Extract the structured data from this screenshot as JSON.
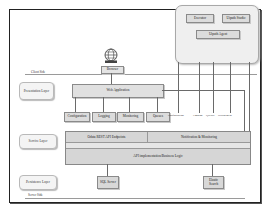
{
  "diagram": {
    "side_labels": {
      "client_side": "Client Side",
      "server_side": "Server Side"
    },
    "layers": {
      "presentation": "Presentation Layer",
      "service": "Service Layer",
      "persistence": "Persistence Layer"
    },
    "client_group": {
      "executor": "Executor",
      "studio": "Uipath Studio",
      "agent": "Uipath Agent"
    },
    "browser": {
      "icon": "globe-icon",
      "label": "Browser"
    },
    "web_application": "Web Application",
    "web_modules": [
      "Configuration",
      "Logging",
      "Monitoring",
      "Queues"
    ],
    "agent_links": [
      "Configuration",
      "Logging",
      "Queues",
      "Deployment"
    ],
    "service_layer": {
      "endpoints": "Odata REST API Endpoints",
      "notification": "Notification & Monitoring",
      "business_logic": "API implementation/Business Logic"
    },
    "storage": {
      "sql": "SQL Server",
      "elastic": "Elastic Search"
    }
  }
}
